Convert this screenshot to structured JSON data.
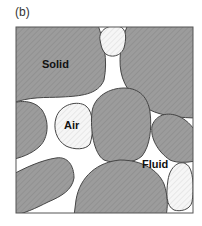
{
  "figure": {
    "panel_label": "(b)",
    "labels": {
      "solid": "Solid",
      "air": "Air",
      "fluid": "Fluid"
    },
    "colors": {
      "solid_fill": "#9a9a9a",
      "air_fill": "#f4f4f4",
      "fluid_fill": "#ffffff",
      "outline": "#444444",
      "frame": "#555555"
    }
  }
}
